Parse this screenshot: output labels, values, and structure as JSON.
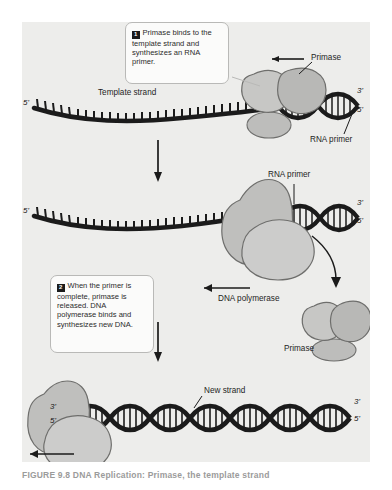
{
  "figure": {
    "caption": "FIGURE 9.8   DNA Replication: Primase, the template strand",
    "background_color": "#ffffff",
    "panel_color": "#ededeb",
    "ink_color": "#1b1b1b",
    "protein_fill": "#b6b6b4",
    "protein_fill_light": "#c9c9c7",
    "box_fill": "#fbfbfa",
    "box_border": "#b9b9b7"
  },
  "steps": [
    {
      "number": "1",
      "text": "Primase binds to the template strand and synthesizes an RNA primer."
    },
    {
      "number": "2",
      "text": "When the primer is complete, primase is released. DNA polymerase binds and synthesizes new DNA."
    }
  ],
  "panel1": {
    "labels": {
      "template_strand": "Template strand",
      "primase": "Primase",
      "rna_primer": "RNA primer",
      "five_prime_left": "5'",
      "three_prime_right": "3'",
      "five_prime_right": "5'"
    }
  },
  "panel2": {
    "labels": {
      "rna_primer": "RNA primer",
      "dna_polymerase": "DNA polymerase",
      "primase": "Primase",
      "five_prime_left": "5'",
      "three_prime_right": "3'",
      "five_prime_right": "5'"
    }
  },
  "panel3": {
    "labels": {
      "new_strand": "New strand",
      "three_prime_left": "3'",
      "five_prime_left": "5'",
      "three_prime_right": "3'",
      "five_prime_right": "5'"
    }
  },
  "icons": {
    "down_arrow": "flow-down-arrow",
    "left_arrow": "direction-left-arrow",
    "curved_arrow": "release-curved-arrow"
  }
}
